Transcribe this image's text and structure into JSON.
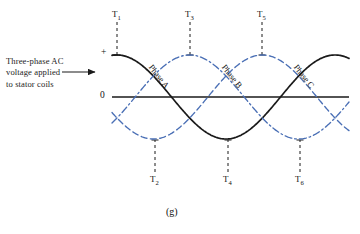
{
  "figure": {
    "letter": "(g)",
    "annotation_lines": [
      "Three-phase AC",
      "voltage applied",
      "to stator coils"
    ],
    "arrow_icon": "right-arrow-icon"
  },
  "axis": {
    "positive_label": "+",
    "zero_label": "0",
    "zero_line_color": "#1a1a1a"
  },
  "time_markers": [
    {
      "name": "T1",
      "base": "T",
      "sub": "1",
      "x": 117,
      "position": "top"
    },
    {
      "name": "T2",
      "base": "T",
      "sub": "2",
      "x": 155,
      "position": "bottom"
    },
    {
      "name": "T3",
      "base": "T",
      "sub": "3",
      "x": 190,
      "position": "top"
    },
    {
      "name": "T4",
      "base": "T",
      "sub": "4",
      "x": 228,
      "position": "bottom"
    },
    {
      "name": "T5",
      "base": "T",
      "sub": "5",
      "x": 262,
      "position": "top"
    },
    {
      "name": "T6",
      "base": "T",
      "sub": "6",
      "x": 300,
      "position": "bottom"
    }
  ],
  "phases": [
    {
      "label": "Phase A",
      "color": "#1a1a1a",
      "style": "solid",
      "phase_deg": 0
    },
    {
      "label": "Phase B",
      "color": "#4a6fb5",
      "style": "dash-dot",
      "phase_deg": -120
    },
    {
      "label": "Phase C",
      "color": "#4a6fb5",
      "style": "dashed",
      "phase_deg": -240
    }
  ],
  "chart_data": {
    "type": "line",
    "title": "",
    "xlabel": "",
    "ylabel": "",
    "ylim": [
      -1,
      1
    ],
    "yticks": [
      0,
      1
    ],
    "ytick_labels": [
      "0",
      "+"
    ],
    "grid": false,
    "legend": "inline-curve-labels",
    "x_markers": [
      "T1",
      "T2",
      "T3",
      "T4",
      "T5",
      "T6"
    ],
    "x_marker_degrees": [
      0,
      60,
      120,
      180,
      240,
      300
    ],
    "series": [
      {
        "name": "Phase A",
        "amplitude": 1,
        "phase_deg": 0,
        "values_at_markers": [
          1.0,
          0.5,
          -0.5,
          -1.0,
          -0.5,
          0.5
        ]
      },
      {
        "name": "Phase B",
        "amplitude": 1,
        "phase_deg": -120,
        "values_at_markers": [
          -0.5,
          -1.0,
          -0.5,
          0.5,
          1.0,
          0.5
        ]
      },
      {
        "name": "Phase C",
        "amplitude": 1,
        "phase_deg": -240,
        "values_at_markers": [
          -0.5,
          0.5,
          1.0,
          0.5,
          -0.5,
          -1.0
        ]
      }
    ]
  }
}
